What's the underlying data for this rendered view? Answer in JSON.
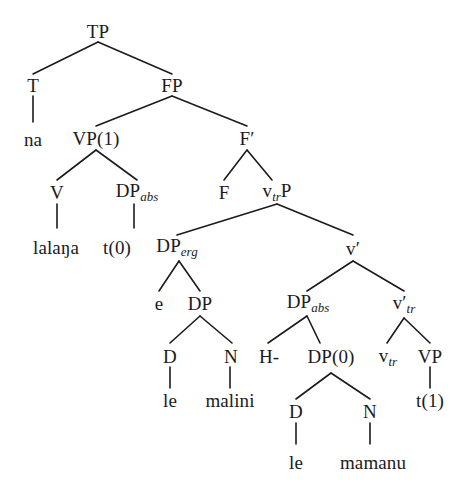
{
  "figure": {
    "type": "syntactic-tree",
    "width": 473,
    "height": 490,
    "ink_color": "#1b1b1b",
    "background_color": "#ffffff"
  },
  "nodes": {
    "tp": "TP",
    "t": "T",
    "fp": "FP",
    "na": "na",
    "vp1": "VP(1)",
    "fbar_base": "F",
    "fbar_prime": "′",
    "v": "V",
    "dp_abs1_base": "DP",
    "dp_abs1_sub": "abs",
    "f": "F",
    "vtrp_base": "v",
    "vtrp_sub": "tr",
    "vtrp_tail": "P",
    "lalanga": "lalaŋa",
    "t0": "t(0)",
    "dp_erg_base": "DP",
    "dp_erg_sub": "erg",
    "vbar_base": "v",
    "vbar_prime": "′",
    "e": "e",
    "dp": "DP",
    "dp_abs2_base": "DP",
    "dp_abs2_sub": "abs",
    "vbar_tr_base": "v",
    "vbar_tr_prime": "′",
    "vbar_tr_sub": "tr",
    "d1": "D",
    "n1": "N",
    "h": "H-",
    "dp0": "DP(0)",
    "vtr_base": "v",
    "vtr_sub": "tr",
    "vp": "VP",
    "le1": "le",
    "malini": "malini",
    "d2": "D",
    "n2": "N",
    "t1": "t(1)",
    "le2": "le",
    "mamanu": "mamanu"
  },
  "sentence": {
    "words": [
      "na",
      "lalaŋa",
      "e",
      "le",
      "malini",
      "H-",
      "le",
      "mamanu"
    ],
    "traces": [
      "t(0)",
      "t(1)"
    ]
  }
}
